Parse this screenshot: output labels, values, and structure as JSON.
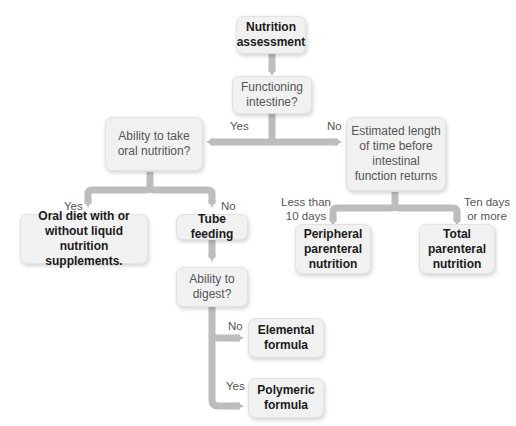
{
  "nodes": {
    "start": "Nutrition assessment",
    "q_intestine": "Functioning intestine?",
    "q_oral": "Ability to take oral nutrition?",
    "q_time": "Estimated length of time before intestinal function returns",
    "oral_diet": "Oral diet with or without liquid nutrition supplements.",
    "tube": "Tube feeding",
    "q_digest": "Ability to digest?",
    "elemental": "Elemental formula",
    "polymeric": "Polymeric formula",
    "ppn": "Peripheral parenteral nutrition",
    "tpn": "Total parenteral nutrition"
  },
  "edges": {
    "intestine_yes": "Yes",
    "intestine_no": "No",
    "oral_yes": "Yes",
    "oral_no": "No",
    "time_short": "Less than 10 days",
    "time_long": "Ten days or more",
    "digest_no": "No",
    "digest_yes": "Yes"
  },
  "colors": {
    "box_fill": "#f1f1f1",
    "connector": "#bdbdbd"
  }
}
